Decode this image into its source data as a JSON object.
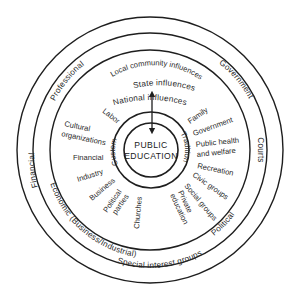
{
  "diagram": {
    "center_label": {
      "line1": "PUBLIC",
      "line2": "EDUCATION"
    },
    "core_ring": {
      "left": "Custom",
      "right": "Tradition"
    },
    "outer_band": {
      "top": "National influences"
    },
    "second_band": {
      "top": "State influences",
      "upper_left": "Professional",
      "left": "Financial",
      "lower_left": "Economic (Business/Industrial)",
      "bottom": "Special interest groups",
      "lower_right": "Political",
      "right": "Courts",
      "upper_right": "Government"
    },
    "community_band": {
      "top": "Local community influences",
      "items": [
        "Labor",
        "Cultural organizations",
        "Financial",
        "Industry",
        "Business",
        "Political parties",
        "Churches",
        "Private education",
        "Social groups",
        "Civic groups",
        "Recreation",
        "Public health and welfare",
        "Government",
        "Family"
      ]
    },
    "arrow": {
      "direction": "bidirectional",
      "orientation": "vertical"
    }
  }
}
